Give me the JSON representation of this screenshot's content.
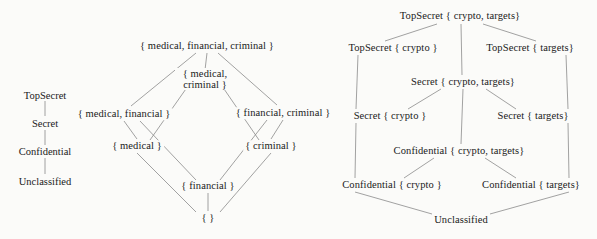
{
  "figure": {
    "type": "lattice-diagram",
    "background_color": "#fbfbf9",
    "line_color": "#8a8a8a",
    "text_color": "#1a1a1a"
  },
  "left_diagram": {
    "name": "security-levels-and-category-lattice",
    "clearance_chain": {
      "name": "linear-security-levels",
      "levels": [
        {
          "id": "topsecret",
          "label": "TopSecret"
        },
        {
          "id": "secret",
          "label": "Secret"
        },
        {
          "id": "confidential",
          "label": "Confidential"
        },
        {
          "id": "unclassified",
          "label": "Unclassified"
        }
      ]
    },
    "category_lattice": {
      "name": "powerset-lattice-of-categories",
      "nodes": [
        {
          "id": "mfc",
          "label": "{ medical, financial, criminal }",
          "x": 207,
          "y": 46
        },
        {
          "id": "mc",
          "label_line1": "{ medical,",
          "label_line2": "criminal }",
          "x": 205,
          "y": 79
        },
        {
          "id": "mf",
          "label": "{ medical, financial }",
          "x": 124,
          "y": 114
        },
        {
          "id": "fc",
          "label": "{ financial, criminal }",
          "x": 283,
          "y": 113
        },
        {
          "id": "m",
          "label": "{ medical }",
          "x": 137,
          "y": 146
        },
        {
          "id": "c",
          "label": "{ criminal }",
          "x": 271,
          "y": 146
        },
        {
          "id": "f",
          "label": "{ financial }",
          "x": 208,
          "y": 186
        },
        {
          "id": "empty",
          "label": "{ }",
          "x": 208,
          "y": 218
        }
      ]
    }
  },
  "right_diagram": {
    "name": "level-compartment-lattice",
    "nodes": [
      {
        "id": "ts-ct",
        "label": "TopSecret  { crypto, targets}",
        "x": 460,
        "y": 16
      },
      {
        "id": "ts-c",
        "label": "TopSecret { crypto }",
        "x": 393,
        "y": 48
      },
      {
        "id": "ts-t",
        "label": "TopSecret { targets}",
        "x": 530,
        "y": 48
      },
      {
        "id": "s-ct",
        "label": "Secret { crypto, targets}",
        "x": 463,
        "y": 82
      },
      {
        "id": "s-c",
        "label": "Secret { crypto }",
        "x": 390,
        "y": 116
      },
      {
        "id": "s-t",
        "label": "Secret { targets}",
        "x": 533,
        "y": 116
      },
      {
        "id": "conf-ct",
        "label": "Confidential  { crypto, targets}",
        "x": 459,
        "y": 151
      },
      {
        "id": "conf-c",
        "label": "Confidential  { crypto }",
        "x": 392,
        "y": 185
      },
      {
        "id": "conf-t",
        "label": "Confidential  { targets}",
        "x": 531,
        "y": 185
      },
      {
        "id": "unclassified",
        "label": "Unclassified",
        "x": 461,
        "y": 220
      }
    ]
  }
}
